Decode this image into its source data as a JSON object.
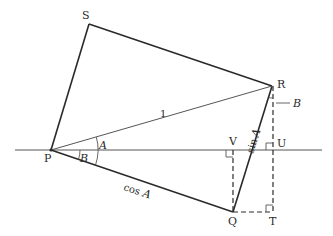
{
  "diagram": {
    "type": "geometry",
    "colors": {
      "line": "#2a2a2a",
      "thin_line": "#555555",
      "background": "#ffffff"
    },
    "points": {
      "P": {
        "label": "P",
        "x": 51,
        "y": 150
      },
      "S": {
        "label": "S",
        "x": 89,
        "y": 24
      },
      "R": {
        "label": "R",
        "x": 272,
        "y": 86
      },
      "Q": {
        "label": "Q",
        "x": 233,
        "y": 212
      },
      "T": {
        "label": "T",
        "x": 273,
        "y": 212
      },
      "U": {
        "label": "U",
        "x": 273,
        "y": 150
      },
      "V": {
        "label": "V",
        "x": 233,
        "y": 150
      }
    },
    "labels": {
      "hyp": "1",
      "cos": "cos",
      "sin": "sin",
      "A": "A",
      "B": "B",
      "cosA_var": "A",
      "sinA_var": "A",
      "B_at_R": "B"
    }
  }
}
